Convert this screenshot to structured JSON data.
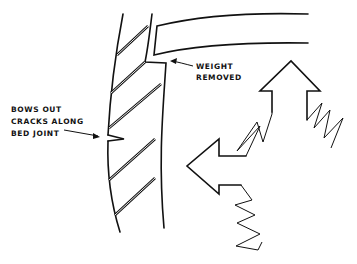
{
  "diagram": {
    "type": "structural-failure-sketch",
    "labels": {
      "weight_removed_line1": "WEIGHT",
      "weight_removed_line2": "REMOVED",
      "bows_out_line1": "BOWS OUT",
      "bows_out_line2": "CRACKS ALONG",
      "bows_out_line3": "BED JOINT"
    },
    "elements": [
      {
        "name": "masonry-wall",
        "description": "curved wall section with diagonal hatching"
      },
      {
        "name": "roof-beam",
        "description": "curved horizontal member bearing on wall top, lifted"
      },
      {
        "name": "crack-notch",
        "description": "V-shaped crack on outer face of wall at bed joint"
      },
      {
        "name": "arrow-up",
        "description": "hollow arrow pointing up with spring tail"
      },
      {
        "name": "arrow-left",
        "description": "hollow arrow pointing left with spring tail"
      }
    ],
    "colors": {
      "line": "#111111",
      "background": "#ffffff"
    }
  }
}
